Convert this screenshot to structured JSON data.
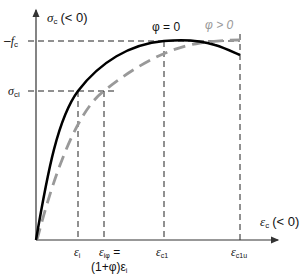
{
  "diagram": {
    "y_axis": {
      "symbol": "σ",
      "subscript": "c",
      "suffix": "(< 0)"
    },
    "x_axis": {
      "symbol": "ε",
      "subscript": "c",
      "suffix": "(< 0)"
    },
    "y_ticks": [
      {
        "prefix": "–",
        "symbol": "f",
        "subscript": "c"
      },
      {
        "prefix": "",
        "symbol": "σ",
        "subscript": "ci"
      }
    ],
    "x_ticks": [
      {
        "symbol": "ε",
        "subscript": "i",
        "suffix": ""
      },
      {
        "symbol": "ε",
        "subscript": "iφ",
        "suffix": " ="
      },
      {
        "symbol": "ε",
        "subscript": "c1",
        "suffix": ""
      },
      {
        "symbol": "ε",
        "subscript": "c1u",
        "suffix": ""
      }
    ],
    "x_tick_extra": "(1+φ)ε",
    "x_tick_extra_sub": "i",
    "curves": [
      {
        "label": "φ = 0",
        "color": "#000000",
        "style": "solid"
      },
      {
        "label": "φ > 0",
        "color": "#999999",
        "style": "dashed"
      }
    ]
  }
}
